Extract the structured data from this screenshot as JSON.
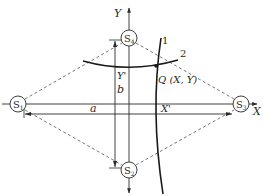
{
  "diagram": {
    "type": "hyperbolic-positioning-geometry",
    "axes": {
      "x_label": "X",
      "y_label": "Y"
    },
    "stations": [
      {
        "id": "S1",
        "label_main": "S",
        "label_sub": "1",
        "position": "left"
      },
      {
        "id": "S2",
        "label_main": "S",
        "label_sub": "2",
        "position": "bottom"
      },
      {
        "id": "S3",
        "label_main": "S",
        "label_sub": "3",
        "position": "right"
      },
      {
        "id": "S4",
        "label_main": "S",
        "label_sub": "4",
        "position": "top"
      }
    ],
    "curves": [
      {
        "id": "1",
        "label": "1"
      },
      {
        "id": "2",
        "label": "2"
      }
    ],
    "point": {
      "label": "Q (X, Y)"
    },
    "dimensions": {
      "a": "a",
      "b": "b",
      "x_prime": "X'",
      "y_prime": "Y'"
    },
    "colors": {
      "line": "#2a2a2a",
      "dashed": "#555555",
      "background": "#ffffff"
    }
  }
}
